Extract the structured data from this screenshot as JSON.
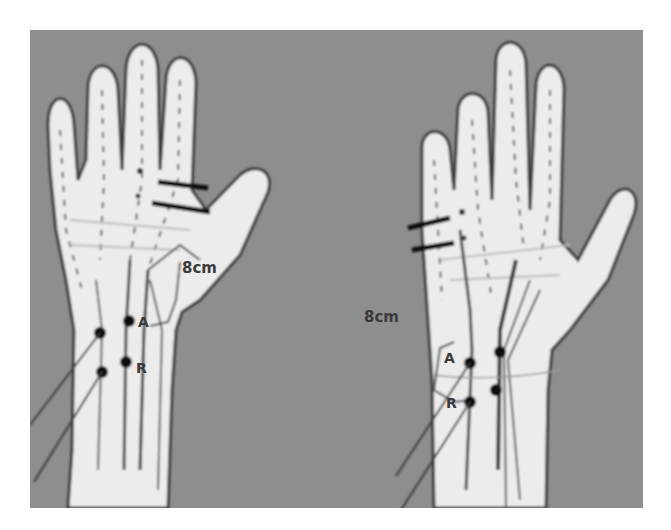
{
  "figure": {
    "background_color": "#8e8e8e",
    "skin_color": "#ececec",
    "outline_color": "#3c3c3c",
    "marker_color": "#111111",
    "panels": [
      {
        "id": "left-hand",
        "distance_label": "8cm",
        "electrode_labels": {
          "active": "A",
          "reference": "R"
        }
      },
      {
        "id": "right-hand",
        "distance_label": "8cm",
        "electrode_labels": {
          "active": "A",
          "reference": "R"
        }
      }
    ]
  }
}
